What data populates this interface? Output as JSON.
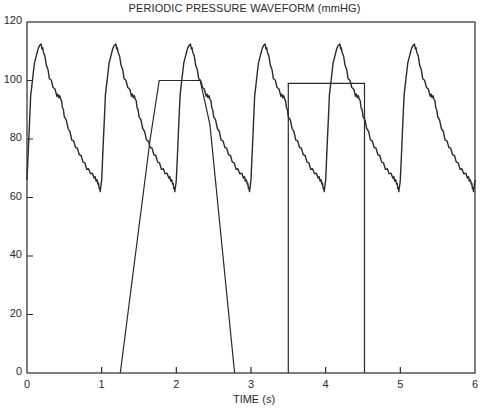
{
  "chart_data": {
    "type": "line",
    "title": "PERIODIC PRESSURE WAVEFORM (mmHG)",
    "xlabel": "TIME (s)",
    "ylabel": "",
    "xlim": [
      0,
      6
    ],
    "ylim": [
      0,
      120
    ],
    "xticks": [
      0,
      1,
      2,
      3,
      4,
      5,
      6
    ],
    "yticks": [
      0,
      20,
      40,
      60,
      80,
      100,
      120
    ],
    "grid": false,
    "legend": null,
    "series": [
      {
        "name": "pressure waveform",
        "period_s": 1.0,
        "one_cycle": {
          "t": [
            0.0,
            0.05,
            0.1,
            0.15,
            0.18,
            0.22,
            0.3,
            0.4,
            0.45,
            0.5,
            0.6,
            0.7,
            0.8,
            0.9,
            0.95,
            0.98,
            1.0
          ],
          "p": [
            66,
            95,
            106,
            111,
            112.5,
            110,
            101,
            95,
            94,
            88,
            80,
            75,
            70,
            67,
            65,
            62,
            66
          ]
        },
        "peaks": [
          [
            0.18,
            112.5
          ],
          [
            1.19,
            112.3
          ],
          [
            2.2,
            112
          ],
          [
            3.2,
            112
          ],
          [
            4.2,
            111.5
          ],
          [
            5.2,
            111.5
          ]
        ],
        "troughs": [
          [
            0.98,
            62
          ],
          [
            1.99,
            62
          ],
          [
            3.0,
            61.5
          ],
          [
            3.99,
            62
          ],
          [
            4.99,
            61.5
          ],
          [
            6.0,
            61
          ]
        ]
      },
      {
        "name": "trapezoid pulse",
        "x": [
          1.25,
          1.65,
          1.77,
          2.32,
          2.45,
          2.78
        ],
        "y": [
          0,
          80,
          100,
          100,
          85,
          0
        ]
      },
      {
        "name": "rectangular pulse",
        "x": [
          3.5,
          3.5,
          4.52,
          4.52
        ],
        "y": [
          0,
          99,
          99,
          0
        ]
      }
    ]
  },
  "colors": {
    "line": "#2a2a2a",
    "background": "#ffffff"
  }
}
